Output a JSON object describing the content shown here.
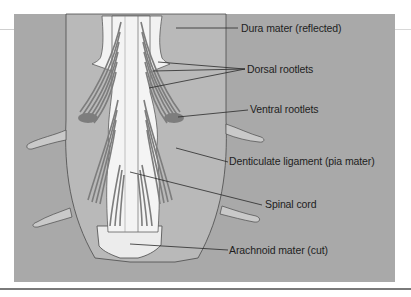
{
  "figure": {
    "colors": {
      "panel_background": "#a9a9a9",
      "dura": "#b9b9b9",
      "cord": "#f4f4f4",
      "rootlets": "#7d7d7d",
      "outline": "#4a4a4a",
      "label_text": "#1e1e1e"
    },
    "labels": [
      {
        "id": "dura-mater",
        "text": "Dura mater (reflected)"
      },
      {
        "id": "dorsal-rootlets",
        "text": "Dorsal rootlets"
      },
      {
        "id": "ventral-rootlets",
        "text": "Ventral rootlets"
      },
      {
        "id": "denticulate-ligament",
        "text": "Denticulate ligament (pia mater)"
      },
      {
        "id": "spinal-cord",
        "text": "Spinal cord"
      },
      {
        "id": "arachnoid-mater",
        "text": "Arachnoid mater (cut)"
      }
    ]
  }
}
